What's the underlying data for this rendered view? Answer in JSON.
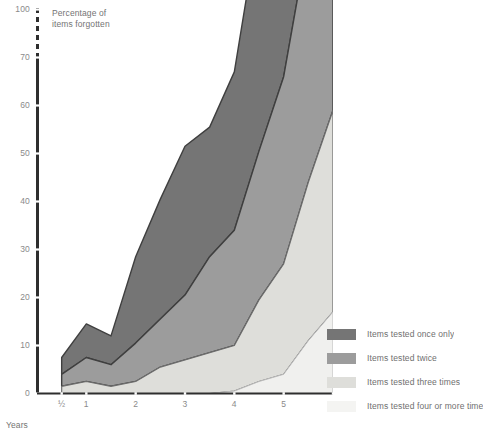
{
  "chart_data": {
    "type": "area",
    "title": "",
    "ylabel": "Percentage of\nitems forgotten",
    "xlabel": "Years",
    "stacked": true,
    "axis_break": {
      "between": [
        70,
        100
      ],
      "style": "dashed"
    },
    "ylim": [
      0,
      100
    ],
    "yticks": [
      0,
      10,
      20,
      30,
      40,
      50,
      60,
      70,
      100
    ],
    "ytick_labels": [
      "0",
      "10",
      "20",
      "30",
      "40",
      "50",
      "60",
      "70",
      "100"
    ],
    "xticks": [
      0.5,
      1,
      2,
      3,
      4,
      5,
      6
    ],
    "xtick_labels": [
      "½",
      "1",
      "2",
      "3",
      "4",
      "5",
      "6"
    ],
    "grid": false,
    "legend_position": "right-bottom",
    "x": [
      0.5,
      1,
      1.5,
      2,
      2.5,
      3,
      3.5,
      4,
      4.5,
      5,
      5.5,
      6
    ],
    "series": [
      {
        "name": "Items tested four or more times",
        "color": "#f0f0ee",
        "values": [
          0,
          0,
          0,
          0,
          0,
          0,
          0,
          0.5,
          2.5,
          4,
          11,
          17
        ]
      },
      {
        "name": "Items tested three times",
        "color": "#dededa",
        "values": [
          1.5,
          2.5,
          1.5,
          2.5,
          5.5,
          7,
          8.5,
          9.5,
          17,
          23,
          33,
          42
        ]
      },
      {
        "name": "Items tested twice",
        "color": "#9c9c9c",
        "values": [
          2.5,
          5,
          4.5,
          8,
          10,
          13.5,
          20,
          24,
          31,
          39,
          51,
          60
        ]
      },
      {
        "name": "Items tested once only",
        "color": "#757575",
        "values": [
          3.5,
          7,
          6,
          18,
          25,
          31,
          27,
          33,
          48,
          64,
          86,
          100
        ]
      }
    ]
  },
  "legend": {
    "items": [
      {
        "label": "Items tested once only",
        "color": "#757575"
      },
      {
        "label": "Items tested twice",
        "color": "#9c9c9c"
      },
      {
        "label": "Items tested three times",
        "color": "#dededa"
      },
      {
        "label": "Items tested four or more time",
        "color": "#f4f4f2"
      }
    ]
  },
  "axes": {
    "y_title": "Percentage of\nitems forgotten",
    "x_title": "Years",
    "y_labels": [
      "100",
      "70",
      "60",
      "50",
      "40",
      "30",
      "20",
      "10",
      "0"
    ],
    "x_labels": [
      "½",
      "1",
      "2",
      "3",
      "4",
      "5",
      "6"
    ]
  }
}
